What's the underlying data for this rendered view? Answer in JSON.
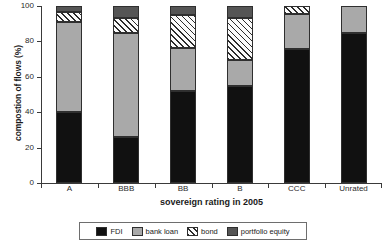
{
  "chart_data": {
    "type": "bar",
    "stacked": true,
    "title": "",
    "xlabel": "sovereign rating in 2005",
    "ylabel": "compostion of flows (%)",
    "ylim": [
      0,
      100
    ],
    "yticks": [
      0,
      20,
      40,
      60,
      80,
      100
    ],
    "ytick_labels": [
      "0",
      "20",
      "40",
      "60",
      "80",
      "100"
    ],
    "grid": false,
    "legend_position": "bottom",
    "categories": [
      "A",
      "BBB",
      "BB",
      "B",
      "CCC",
      "Unrated"
    ],
    "series": [
      {
        "name": "FDI",
        "color": "#111111",
        "pattern": "solid",
        "values": [
          40,
          26,
          52,
          55,
          75.5,
          84.5
        ]
      },
      {
        "name": "bank loan",
        "color": "#a9a9a9",
        "pattern": "solid",
        "values": [
          51,
          59,
          24.5,
          14.5,
          20,
          15.5
        ]
      },
      {
        "name": "bond",
        "color": "#ffffff",
        "pattern": "hatch",
        "values": [
          5.5,
          8,
          18.5,
          24,
          4.5,
          0
        ]
      },
      {
        "name": "portfolio equity",
        "color": "#555555",
        "pattern": "solid",
        "values": [
          3.5,
          7,
          5,
          6.5,
          0,
          0
        ]
      }
    ]
  },
  "legend": {
    "items": [
      {
        "label": "FDI"
      },
      {
        "label": "bank loan"
      },
      {
        "label": "bond"
      },
      {
        "label": "portfolio equity"
      }
    ]
  }
}
